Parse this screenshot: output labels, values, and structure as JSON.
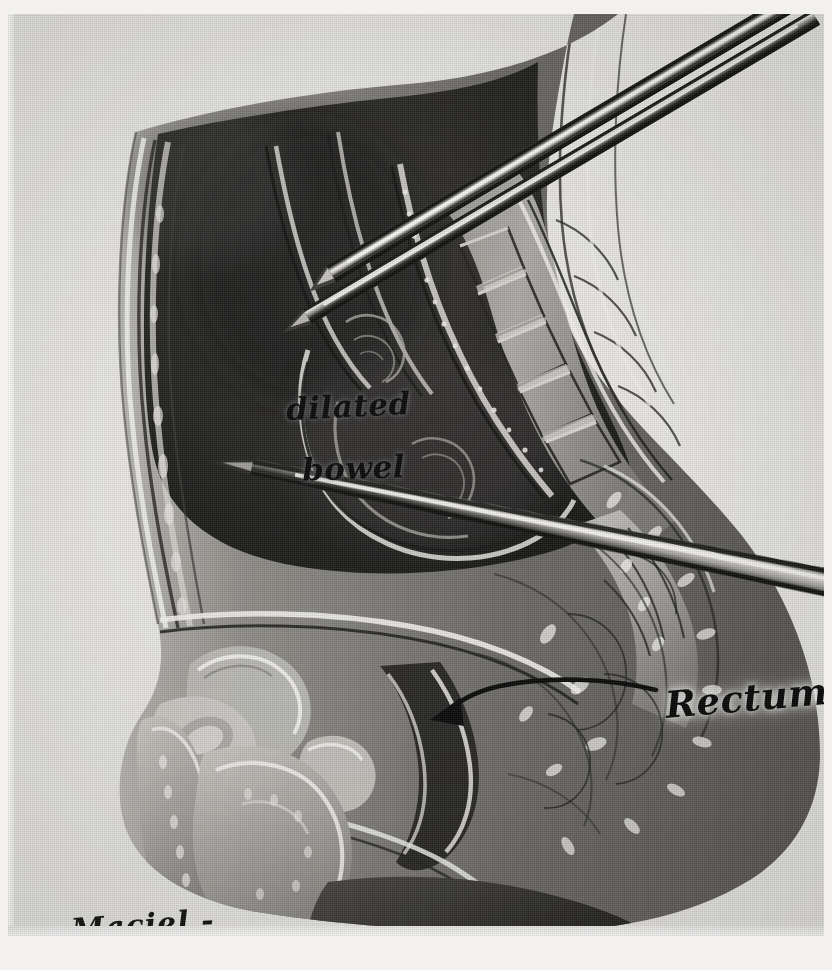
{
  "figure": {
    "kind": "anatomical-illustration",
    "medium": "grayscale halftone print on textured paper",
    "background_color": "#e9e8e4",
    "ink_color": "#0c0c0c"
  },
  "labels": {
    "dilated": "dilated",
    "bowel": "bowel",
    "rectum": "Rectum",
    "signature": "- Maciel -"
  },
  "annotations": {
    "leader_arrow": {
      "name": "rectum-leader-arrow",
      "from_label": "Rectum",
      "points_to": "rectum"
    }
  },
  "instruments": [
    {
      "name": "upper-instrument-shaft-outer",
      "description": "metal probe shaft entering from top right"
    },
    {
      "name": "upper-instrument-shaft-inner",
      "description": "second metal probe shaft parallel to the first"
    },
    {
      "name": "lower-instrument-probe",
      "description": "tapered metal pointer entering from right, tip at rectosigmoid"
    }
  ],
  "anatomy": [
    {
      "name": "anterior-abdominal-wall"
    },
    {
      "name": "dilated-bowel-mass"
    },
    {
      "name": "lumbar-vertebrae"
    },
    {
      "name": "sacrum"
    },
    {
      "name": "urinary-bladder"
    },
    {
      "name": "pubic-symphysis"
    },
    {
      "name": "prostate"
    },
    {
      "name": "rectum"
    },
    {
      "name": "gluteal-soft-tissue"
    },
    {
      "name": "penis"
    },
    {
      "name": "scrotum"
    },
    {
      "name": "thigh"
    }
  ],
  "colors": {
    "paper": "#e9e8e4",
    "dark_tissue": "#2a2a2a",
    "mid_tissue": "#8d8b87",
    "light_tissue": "#cfcdc8",
    "highlight": "#f4f3f0",
    "ink": "#0c0c0c",
    "metal_light": "#e8e7e4",
    "metal_dark": "#1c1c1c"
  }
}
